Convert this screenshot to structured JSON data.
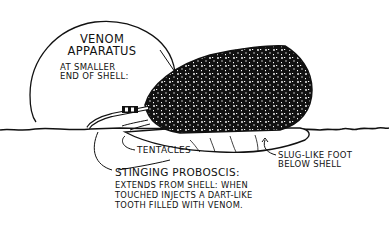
{
  "diagram": {
    "labels": {
      "venom_title_line1": "VENOM",
      "venom_title_line2": "APPARATUS",
      "venom_sub_line1": "AT SMALLER",
      "venom_sub_line2": "END OF SHELL:",
      "tentacles": "TENTACLES",
      "foot_line1": "SLUG-LIKE FOOT",
      "foot_line2": "BELOW SHELL",
      "proboscis_title": "STINGING PROBOSCIS:",
      "proboscis_line1": "EXTENDS FROM SHELL: WHEN",
      "proboscis_line2": "TOUCHED INJECTS A DART-LIKE",
      "proboscis_line3": "TOOTH FILLED WITH VENOM."
    },
    "colors": {
      "ink": "#111111",
      "background": "#ffffff"
    }
  }
}
